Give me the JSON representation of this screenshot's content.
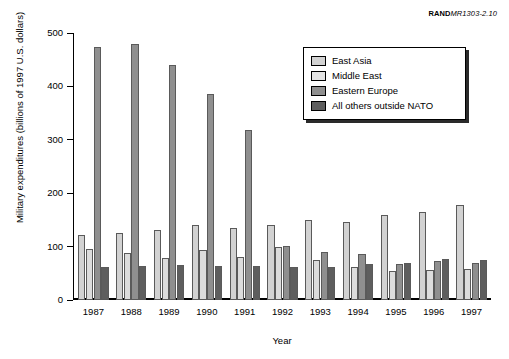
{
  "credit": {
    "org": "RAND",
    "doc_id": "MR1303-2.10"
  },
  "chart_data": {
    "type": "bar",
    "title": "",
    "xlabel": "Year",
    "ylabel": "Military expenditures (billions of 1997 U.S. dollars)",
    "categories": [
      "1987",
      "1988",
      "1989",
      "1990",
      "1991",
      "1992",
      "1993",
      "1994",
      "1995",
      "1996",
      "1997"
    ],
    "series": [
      {
        "name": "East Asia",
        "color": "#d2d2d2",
        "values": [
          122,
          126,
          131,
          140,
          135,
          141,
          149,
          147,
          159,
          165,
          177
        ]
      },
      {
        "name": "Middle East",
        "color": "#dcdcdc",
        "values": [
          95,
          88,
          78,
          93,
          80,
          99,
          74,
          62,
          55,
          56,
          59
        ]
      },
      {
        "name": "Eastern Europe",
        "color": "#8f8f8f",
        "values": [
          474,
          480,
          440,
          386,
          319,
          101,
          89,
          87,
          68,
          73,
          69
        ]
      },
      {
        "name": "All others outside NATO",
        "color": "#5e5e5e",
        "values": [
          62,
          63,
          65,
          63,
          63,
          62,
          62,
          67,
          70,
          76,
          75
        ]
      }
    ],
    "ylim": [
      0,
      500
    ],
    "yticks": [
      0,
      100,
      200,
      300,
      400,
      500
    ],
    "grid": false,
    "legend_position": "top-right"
  }
}
